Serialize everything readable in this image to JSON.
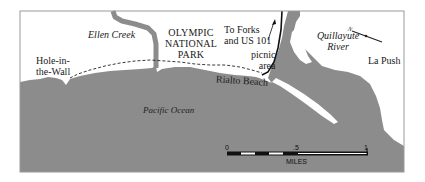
{
  "map": {
    "labels": {
      "ellen_creek": "Ellen Creek",
      "park_line1": "OLYMPIC",
      "park_line2": "NATIONAL",
      "park_line3": "PARK",
      "forks_line1": "To Forks",
      "forks_line2": "and US 101",
      "river_line1": "Quillayute",
      "river_line2": "River",
      "la_push": "La Push",
      "hole_line1": "Hole-in-",
      "hole_line2": "the-Wall",
      "picnic_line1": "picnic",
      "picnic_line2": "area",
      "rialto": "Rialto Beach",
      "ocean": "Pacific Ocean"
    },
    "compass": {
      "label": "N",
      "icon": "north-arrow-icon"
    },
    "scale_bar": {
      "ticks": [
        "0",
        ".5",
        "1"
      ],
      "unit": "MILES"
    },
    "colors": {
      "water": "#8c8c8c",
      "land": "#ffffff",
      "frame": "#9a9a9a",
      "trail": "#222222",
      "road": "#111111"
    }
  }
}
